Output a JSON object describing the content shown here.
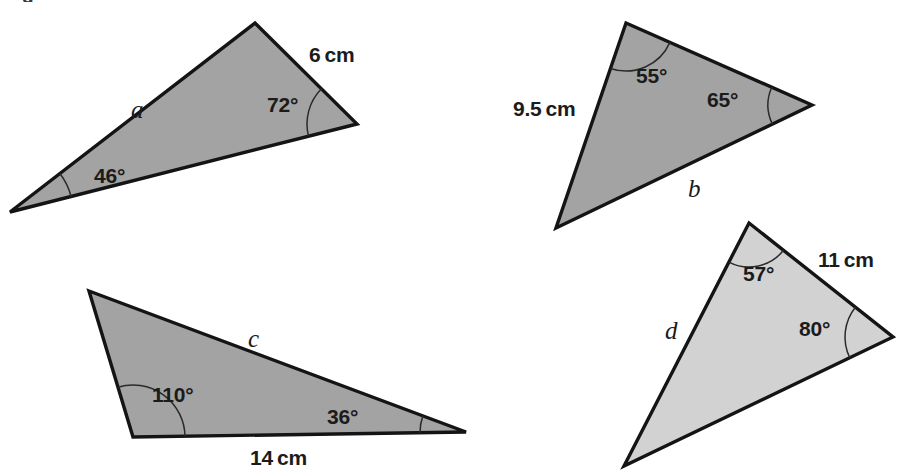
{
  "figure": {
    "background_color": "#ffffff",
    "cut_off_text_top": "g",
    "stroke_color": "#141414",
    "arc_color": "#2a2a2a"
  },
  "triangles": [
    {
      "id": "a",
      "name": "triangle-a",
      "fill_color": "#a3a3a3",
      "side_label": "a",
      "side_label_pos": {
        "x": 131,
        "y": 97
      },
      "vertices": [
        {
          "x": 10,
          "y": 212
        },
        {
          "x": 255,
          "y": 23
        },
        {
          "x": 357,
          "y": 124
        }
      ],
      "angles": [
        {
          "name": "angle-46",
          "value": "46°",
          "vertex_index": 0,
          "label_pos": {
            "x": 94,
            "y": 165
          },
          "arc_radius": 63
        },
        {
          "name": "angle-72",
          "value": "72°",
          "vertex_index": 2,
          "label_pos": {
            "x": 267,
            "y": 94
          },
          "arc_radius": 50
        }
      ],
      "lengths": [
        {
          "name": "length-6cm",
          "value": "6 cm",
          "pos": {
            "x": 309,
            "y": 44
          }
        }
      ]
    },
    {
      "id": "b",
      "name": "triangle-b",
      "fill_color": "#a3a3a3",
      "side_label": "b",
      "side_label_pos": {
        "x": 688,
        "y": 176
      },
      "vertices": [
        {
          "x": 626,
          "y": 23
        },
        {
          "x": 812,
          "y": 105
        },
        {
          "x": 556,
          "y": 228
        }
      ],
      "angles": [
        {
          "name": "angle-55",
          "value": "55°",
          "vertex_index": 0,
          "label_pos": {
            "x": 636,
            "y": 65
          },
          "arc_radius": 48
        },
        {
          "name": "angle-65",
          "value": "65°",
          "vertex_index": 1,
          "label_pos": {
            "x": 707,
            "y": 89
          },
          "arc_radius": 44
        }
      ],
      "lengths": [
        {
          "name": "length-9.5cm",
          "value": "9.5 cm",
          "pos": {
            "x": 513,
            "y": 98
          }
        }
      ]
    },
    {
      "id": "c",
      "name": "triangle-c",
      "fill_color": "#a3a3a3",
      "side_label": "c",
      "side_label_pos": {
        "x": 248,
        "y": 326
      },
      "vertices": [
        {
          "x": 89,
          "y": 291
        },
        {
          "x": 466,
          "y": 432
        },
        {
          "x": 133,
          "y": 437
        }
      ],
      "angles": [
        {
          "name": "angle-110",
          "value": "110°",
          "vertex_index": 2,
          "label_pos": {
            "x": 152,
            "y": 384
          },
          "arc_radius": 52
        },
        {
          "name": "angle-36",
          "value": "36°",
          "vertex_index": 1,
          "label_pos": {
            "x": 327,
            "y": 406
          },
          "arc_radius": 46
        }
      ],
      "lengths": [
        {
          "name": "length-14cm",
          "value": "14 cm",
          "pos": {
            "x": 250,
            "y": 447
          }
        }
      ]
    },
    {
      "id": "d",
      "name": "triangle-d",
      "fill_color": "#d2d2d2",
      "side_label": "d",
      "side_label_pos": {
        "x": 665,
        "y": 318
      },
      "vertices": [
        {
          "x": 749,
          "y": 223
        },
        {
          "x": 893,
          "y": 337
        },
        {
          "x": 624,
          "y": 466
        }
      ],
      "angles": [
        {
          "name": "angle-57",
          "value": "57°",
          "vertex_index": 0,
          "label_pos": {
            "x": 743,
            "y": 263
          },
          "arc_radius": 44
        },
        {
          "name": "angle-80",
          "value": "80°",
          "vertex_index": 1,
          "label_pos": {
            "x": 799,
            "y": 318
          },
          "arc_radius": 48
        }
      ],
      "lengths": [
        {
          "name": "length-11cm",
          "value": "11 cm",
          "pos": {
            "x": 818,
            "y": 249
          }
        }
      ]
    }
  ]
}
